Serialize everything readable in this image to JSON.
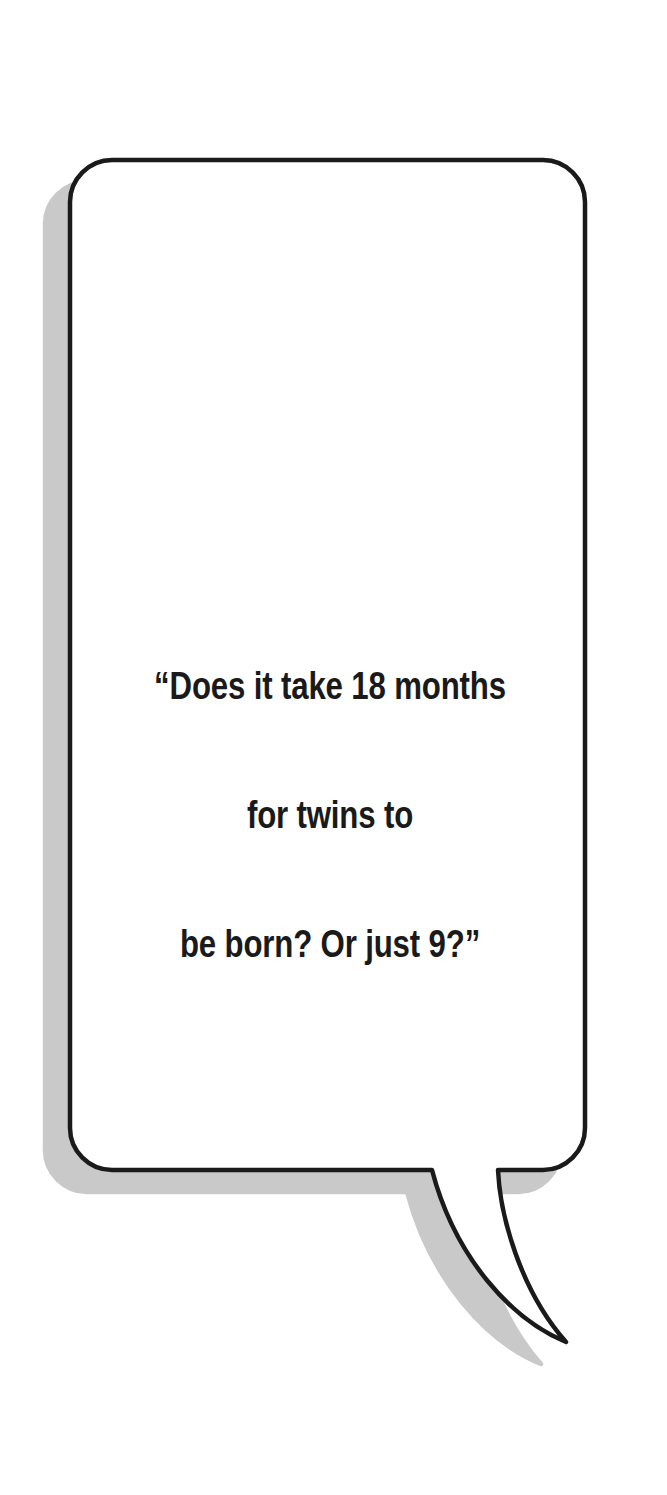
{
  "canvas": {
    "width": 667,
    "height": 1495,
    "background_color": "#ffffff"
  },
  "bubble": {
    "name": "speech-bubble",
    "shape": "rounded-rectangle-with-curved-tail",
    "fill_color": "#ffffff",
    "stroke_color": "#1a1a1a",
    "stroke_width": 4.5,
    "corner_radius": 42,
    "body_bounds": {
      "left": 70,
      "top": 160,
      "right": 585,
      "bottom": 1170
    },
    "shadow": {
      "color": "#c9c9c9",
      "offset_x": -25,
      "offset_y": 22
    },
    "tail": {
      "left_anchor_x": 407,
      "right_anchor_x": 498,
      "anchor_y": 1168,
      "tip_x": 565,
      "tip_y": 1342,
      "direction": "down-right"
    }
  },
  "quote": {
    "name": "quote-text",
    "full_text": "“Does it take 18 months for twins to be born? Or just 9?”",
    "color": "#1a1a1a",
    "font_size_px": 39,
    "line_height_px": 43,
    "align": "center",
    "lines": [
      "“Does it take 18 months",
      "for twins to",
      "be born? Or just 9?”"
    ]
  }
}
